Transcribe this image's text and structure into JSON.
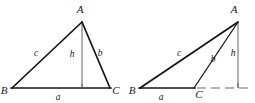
{
  "figure": {
    "type": "geometry-diagram",
    "background_color": "#ffffff",
    "line_color": "#141414",
    "altitude_color": "#6f6f6f",
    "diagrams": [
      {
        "id": "acute-triangle",
        "name": "acute-triangle",
        "vertices": [
          {
            "name": "A",
            "label": "A",
            "x": 82,
            "y": 22,
            "label_x": 80,
            "label_y": 13
          },
          {
            "name": "B",
            "label": "B",
            "x": 12,
            "y": 88,
            "label_x": 4,
            "label_y": 94
          },
          {
            "name": "C",
            "label": "C",
            "x": 110,
            "y": 88,
            "label_x": 114,
            "label_y": 94
          }
        ],
        "sides": [
          {
            "name": "c",
            "label": "c",
            "from": "B",
            "to": "A",
            "label_x": 36,
            "label_y": 56
          },
          {
            "name": "b",
            "label": "b",
            "from": "A",
            "to": "C",
            "label_x": 99,
            "label_y": 56
          },
          {
            "name": "a",
            "label": "a",
            "from": "B",
            "to": "C",
            "label_x": 58,
            "label_y": 99
          }
        ],
        "altitude": {
          "name": "h",
          "label": "h",
          "from_x": 82,
          "from_y": 22,
          "to_x": 82,
          "to_y": 88,
          "label_x": 71,
          "label_y": 57,
          "foot_inside_base": true
        }
      },
      {
        "id": "obtuse-triangle",
        "name": "obtuse-triangle",
        "vertices": [
          {
            "name": "A",
            "label": "A",
            "x": 238,
            "y": 22,
            "label_x": 234,
            "label_y": 13
          },
          {
            "name": "B",
            "label": "B",
            "x": 140,
            "y": 88,
            "label_x": 131,
            "label_y": 94
          },
          {
            "name": "C",
            "label": "C",
            "x": 194,
            "y": 88,
            "label_x": 196,
            "label_y": 97
          }
        ],
        "sides": [
          {
            "name": "c",
            "label": "c",
            "from": "B",
            "to": "A",
            "label_x": 179,
            "label_y": 56
          },
          {
            "name": "b",
            "label": "b",
            "from": "A",
            "to": "C",
            "label_x": 212,
            "label_y": 61
          },
          {
            "name": "a",
            "label": "a",
            "from": "B",
            "to": "C",
            "label_x": 161,
            "label_y": 100
          }
        ],
        "altitude": {
          "name": "h",
          "label": "h",
          "from_x": 238,
          "from_y": 22,
          "to_x": 238,
          "to_y": 88,
          "label_x": 233,
          "label_y": 56,
          "foot_inside_base": false
        },
        "base_extension": {
          "name": "base-extension",
          "from_x": 196,
          "from_y": 88,
          "to_x": 251,
          "to_y": 88,
          "dashed": true
        }
      }
    ]
  }
}
